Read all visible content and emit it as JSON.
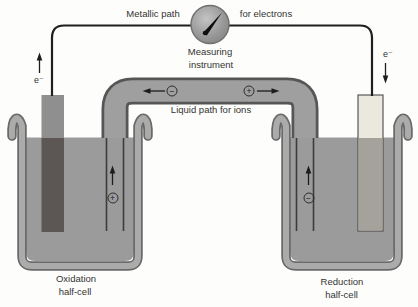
{
  "figure": {
    "type": "electrochemical-cell-diagram"
  },
  "labels": {
    "metallic_path": "Metallic path",
    "for_electrons": "for electrons",
    "measuring_line1": "Measuring",
    "measuring_line2": "instrument",
    "liquid_path": "Liquid path for ions",
    "electron_left": "e⁻",
    "electron_right": "e⁻",
    "oxidation_line1": "Oxidation",
    "oxidation_line2": "half-cell",
    "reduction_line1": "Reduction",
    "reduction_line2": "half-cell"
  },
  "ions": {
    "bridge_left_symbol": "−",
    "bridge_right_symbol": "+",
    "left_arm_symbol": "+",
    "right_arm_symbol": "−"
  },
  "colors": {
    "liquid": "#9b9b9b",
    "beaker_wall": "#ababab",
    "beaker_outline": "#6a6a6a",
    "bridge_fill": "#9f9f9f",
    "bridge_outline": "#565656",
    "wire": "#1f1f1f",
    "gauge_body": "#9a9a9a",
    "needle": "#0e0e0e",
    "electrode_left_above": "#8f8f8f",
    "electrode_left_below": "#5c5754",
    "electrode_right_above": "#ebe8de",
    "electrode_right_below": "#a4a29a"
  }
}
